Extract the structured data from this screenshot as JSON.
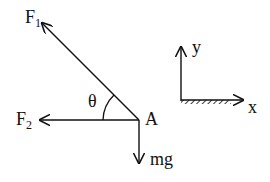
{
  "diagram": {
    "type": "free-body-diagram",
    "point": {
      "label": "A",
      "x": 139,
      "y": 120
    },
    "angle": {
      "label": "θ",
      "between": [
        "F1",
        "F2"
      ]
    },
    "forces": [
      {
        "id": "F1",
        "label": "F",
        "subscript": "1",
        "direction": "up-left"
      },
      {
        "id": "F2",
        "label": "F",
        "subscript": "2",
        "direction": "left"
      },
      {
        "id": "mg",
        "label": "mg",
        "direction": "down"
      }
    ],
    "axes": {
      "x_label": "x",
      "y_label": "y",
      "ground_hatched": true
    }
  },
  "colors": {
    "ink": "#111111",
    "background": "#ffffff"
  }
}
